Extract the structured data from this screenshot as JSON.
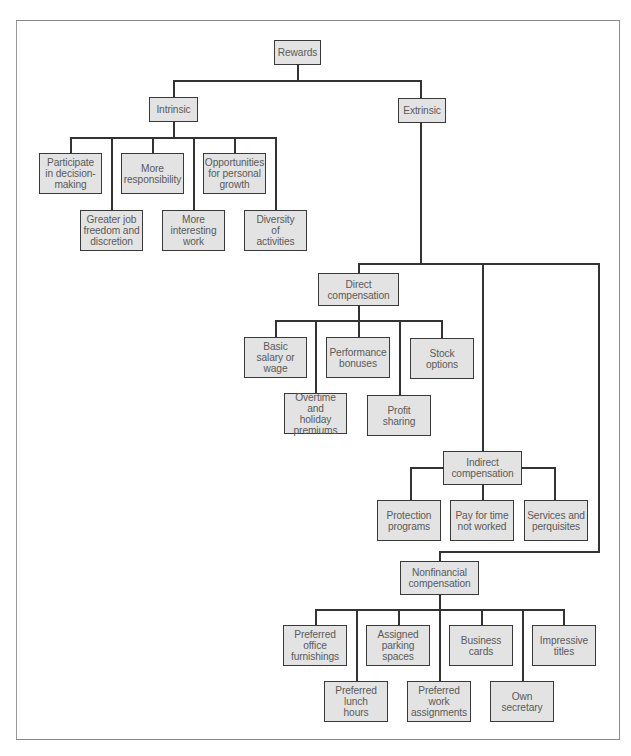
{
  "diagram": {
    "type": "hierarchy",
    "colors": {
      "box_fill": "#e3e3e3",
      "box_border": "#3a3a3a",
      "line": "#333333",
      "text": "#5a5a5a",
      "frame": "#8a8a8a"
    },
    "root": {
      "label": "Rewards"
    },
    "intrinsic": {
      "label": "Intrinsic",
      "children": [
        "Participate\nin decision-\nmaking",
        "Greater job\nfreedom and\ndiscretion",
        "More\nresponsibility",
        "More\ninteresting\nwork",
        "Opportunities\nfor personal\ngrowth",
        "Diversity\nof\nactivities"
      ]
    },
    "extrinsic": {
      "label": "Extrinsic",
      "direct": {
        "label": "Direct\ncompensation",
        "children": [
          "Basic\nsalary or\nwage",
          "Overtime and\nholiday\npremiums",
          "Performance\nbonuses",
          "Profit\nsharing",
          "Stock\noptions"
        ]
      },
      "indirect": {
        "label": "Indirect\ncompensation",
        "children": [
          "Protection\nprograms",
          "Pay for time\nnot worked",
          "Services and\nperquisites"
        ]
      },
      "nonfinancial": {
        "label": "Nonfinancial\ncompensation",
        "children": [
          "Preferred\noffice\nfurnishings",
          "Preferred\nlunch\nhours",
          "Assigned\nparking\nspaces",
          "Preferred\nwork\nassignments",
          "Business\ncards",
          "Own\nsecretary",
          "Impressive\ntitles"
        ]
      }
    }
  }
}
